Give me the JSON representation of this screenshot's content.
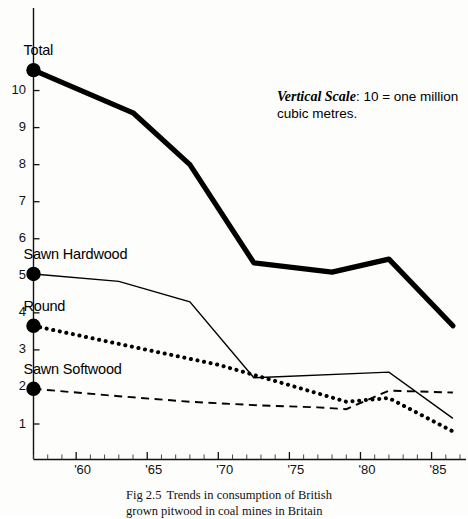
{
  "figure": {
    "caption_number": "Fig 2.5",
    "caption_line1": "Trends in consumption of British",
    "caption_line2": "grown pitwood in coal mines in Britain"
  },
  "annotation": {
    "emphasis": "Vertical Scale",
    "line1_rest": ": 10 = one million",
    "line2": "cubic metres."
  },
  "axes": {
    "y_ticks": [
      "10",
      "9",
      "8",
      "7",
      "6",
      "5",
      "4",
      "3",
      "2",
      "1"
    ],
    "x_ticks": [
      "'60",
      "'65",
      "'70",
      "'75",
      "'80",
      "'85"
    ]
  },
  "series_labels": {
    "total": "Total",
    "sawn_hardwood": "Sawn Hardwood",
    "round": "Round",
    "sawn_softwood": "Sawn Softwood"
  },
  "chart_data": {
    "type": "line",
    "subtitle": "Vertical Scale: 10 = one million cubic metres.",
    "xlabel": "",
    "ylabel": "",
    "xlim": [
      1957,
      1987
    ],
    "ylim": [
      0,
      11.2
    ],
    "grid": false,
    "legend": "inline-start-labels",
    "x_tick_values": [
      1960,
      1965,
      1970,
      1975,
      1980,
      1985
    ],
    "x_tick_labels": [
      "'60",
      "'65",
      "'70",
      "'75",
      "'80",
      "'85"
    ],
    "y_tick_values": [
      1,
      2,
      3,
      4,
      5,
      6,
      7,
      8,
      9,
      10
    ],
    "y_tick_labels": [
      "1",
      "2",
      "3",
      "4",
      "5",
      "6",
      "7",
      "8",
      "9",
      "10"
    ],
    "series": [
      {
        "name": "Total",
        "style": "solid-thick",
        "marker": "filled-circle-at-start",
        "x": [
          1957,
          1964,
          1968,
          1972.5,
          1978,
          1982,
          1986.5
        ],
        "values": [
          10.55,
          9.4,
          8.0,
          5.35,
          5.1,
          5.45,
          3.65
        ]
      },
      {
        "name": "Sawn Hardwood",
        "style": "solid-thin",
        "marker": "filled-circle-at-start",
        "x": [
          1957,
          1963,
          1968,
          1972.5,
          1982,
          1986.5
        ],
        "values": [
          5.05,
          4.85,
          4.3,
          2.25,
          2.4,
          1.15
        ]
      },
      {
        "name": "Round",
        "style": "dotted",
        "marker": "filled-circle-at-start",
        "x": [
          1957,
          1965,
          1970,
          1975,
          1979,
          1982,
          1986.5
        ],
        "values": [
          3.65,
          3.0,
          2.6,
          2.05,
          1.6,
          1.7,
          0.8
        ]
      },
      {
        "name": "Sawn Softwood",
        "style": "dashed",
        "marker": "filled-circle-at-start",
        "x": [
          1957,
          1963,
          1968,
          1973,
          1977,
          1979,
          1982,
          1986.5
        ],
        "values": [
          1.95,
          1.75,
          1.6,
          1.5,
          1.45,
          1.4,
          1.9,
          1.85
        ]
      }
    ]
  }
}
